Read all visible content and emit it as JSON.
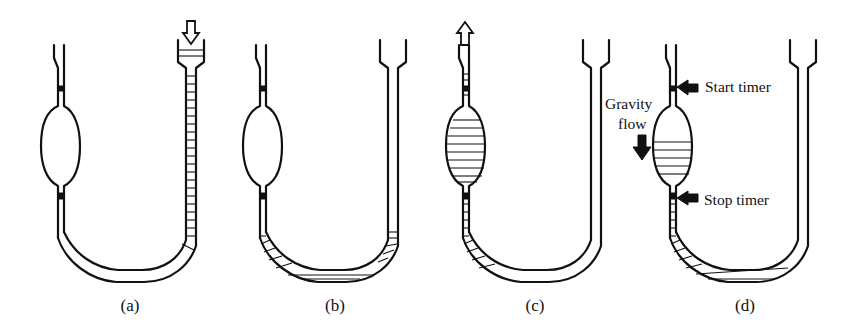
{
  "figure": {
    "panels": [
      {
        "id": "a",
        "label": "(a)",
        "step": "Fill: liquid poured into the wide arm",
        "arrow": "down-into-funnel"
      },
      {
        "id": "b",
        "label": "(b)",
        "step": "Liquid settles in the U bend",
        "arrow": "none"
      },
      {
        "id": "c",
        "label": "(c)",
        "step": "Liquid drawn up into the bulb by suction",
        "arrow": "up-from-capillary"
      },
      {
        "id": "d",
        "label": "(d)",
        "step": "Timing the gravity flow between marks",
        "arrow": "none"
      }
    ],
    "annotations": {
      "start_timer": "Start timer",
      "stop_timer": "Stop timer",
      "gravity_line1": "Gravity",
      "gravity_line2": "flow"
    },
    "colors": {
      "ink": "#111111",
      "background": "#ffffff"
    }
  }
}
